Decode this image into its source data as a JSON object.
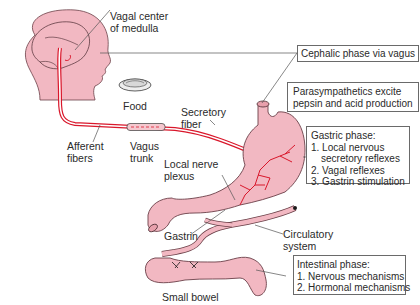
{
  "figure": {
    "colors": {
      "tissue_fill": "#f2b8c2",
      "tissue_stroke": "#6b4048",
      "nerve": "#d9172b",
      "nerve_light": "#ffffff",
      "text": "#2a2a2a",
      "box_border": "#6a6a6a",
      "leader_line": "#555555"
    }
  },
  "labels": {
    "vagal_center": [
      "Vagal center",
      "of medulla"
    ],
    "food": "Food",
    "secretory_fiber": [
      "Secretory",
      "fiber"
    ],
    "afferent_fibers": [
      "Afferent",
      "fibers"
    ],
    "vagus_trunk": [
      "Vagus",
      "trunk"
    ],
    "local_nerve_plexus": [
      "Local nerve",
      "plexus"
    ],
    "gastrin": "Gastrin",
    "circulatory_system": [
      "Circulatory",
      "system"
    ],
    "small_bowel": "Small bowel"
  },
  "boxes": {
    "cephalic": {
      "lines": [
        "Cephalic phase via vagus"
      ]
    },
    "parasympathetics": {
      "lines": [
        "Parasympathetics excite",
        "pepsin and acid production"
      ]
    },
    "gastric": {
      "title": "Gastric phase:",
      "items": [
        "1. Local nervous",
        "secretory reflexes",
        "2. Vagal reflexes",
        "3. Gastrin stimulation"
      ]
    },
    "intestinal": {
      "title": "Intestinal phase:",
      "items": [
        "1. Nervous mechanisms",
        "2. Hormonal mechanisms"
      ]
    }
  }
}
